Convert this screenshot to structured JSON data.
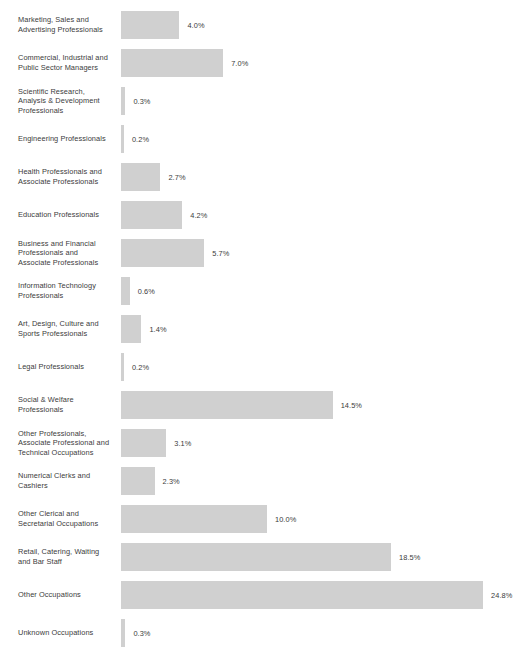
{
  "chart_data": {
    "type": "bar",
    "orientation": "horizontal",
    "title": "",
    "subtitle": "",
    "xlabel": "",
    "ylabel": "",
    "grid": false,
    "legend": false,
    "axis_visible": false,
    "value_suffix": "%",
    "xlim": [
      0,
      24.8
    ],
    "bar_color": "#d0d0d0",
    "text_color": "#3b3b3b",
    "background_color": "#ffffff",
    "px_per_percent": 14.6,
    "categories": [
      "Marketing, Sales and\nAdvertising Professionals",
      "Commercial, Industrial and\nPublic Sector Managers",
      "Scientific Research,\nAnalysis & Development\nProfessionals",
      "Engineering Professionals",
      "Health Professionals and\nAssociate Professionals",
      "Education Professionals",
      "Business and Financial\nProfessionals and\nAssociate Professionals",
      "Information Technology\nProfessionals",
      "Art, Design, Culture and\nSports Professionals",
      "Legal Professionals",
      "Social & Welfare\nProfessionals",
      "Other Professionals,\nAssociate Professional and\nTechnical Occupations",
      "Numerical Clerks and\nCashiers",
      "Other Clerical and\nSecretarial Occupations",
      "Retail, Catering, Waiting\nand Bar Staff",
      "Other Occupations",
      "Unknown Occupations"
    ],
    "values": [
      4.0,
      7.0,
      0.3,
      0.2,
      2.7,
      4.2,
      5.7,
      0.6,
      1.4,
      0.2,
      14.5,
      3.1,
      2.3,
      10.0,
      18.5,
      24.8,
      0.3
    ],
    "value_labels": [
      "4.0%",
      "7.0%",
      "0.3%",
      "0.2%",
      "2.7%",
      "4.2%",
      "5.7%",
      "0.6%",
      "1.4%",
      "0.2%",
      "14.5%",
      "3.1%",
      "2.3%",
      "10.0%",
      "18.5%",
      "24.8%",
      "0.3%"
    ]
  }
}
